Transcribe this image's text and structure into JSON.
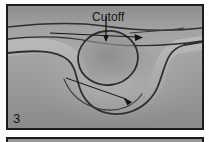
{
  "figure": {
    "panels": [
      {
        "number": "3",
        "caption_label": "Cutoff",
        "subject": "aerial photograph of a meandering river with a neck cutoff",
        "annotations": [
          {
            "name": "cutoff-label",
            "text": "Cutoff"
          },
          {
            "name": "cutoff-pointer-line",
            "text": ""
          },
          {
            "name": "upper-flow-arrow",
            "text": ""
          },
          {
            "name": "lower-flow-arrow",
            "text": ""
          }
        ]
      },
      {
        "number": "4",
        "caption_label": "",
        "subject": "top edge of the next photographic plate"
      }
    ]
  },
  "colors": {
    "photo_mid_gray": "#9d9d9d",
    "photo_light_gray": "#b4b4b4",
    "photo_dark_gray": "#7c7c7c",
    "frame_black": "#1c1c1c",
    "channel_line": "#2e2e2e",
    "annotation_black": "#141414",
    "page_white": "#fdfdfd"
  },
  "labels": {
    "cutoff": "Cutoff",
    "panel_three": "3"
  }
}
